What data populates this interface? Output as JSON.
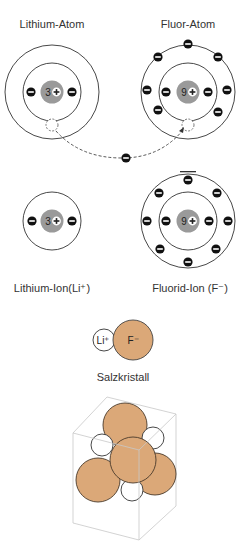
{
  "diagram": {
    "colors": {
      "shell": "#333333",
      "nucleus": "#9a9a9a",
      "electron": "#111111",
      "fluoride_fill": "#dba878",
      "lithium_fill": "#ffffff",
      "cube": "#bdbdbd"
    }
  },
  "atoms": {
    "lithium_atom": {
      "label": "Lithium-Atom",
      "nucleus": "3"
    },
    "fluor_atom": {
      "label": "Fluor-Atom",
      "nucleus": "9"
    },
    "lithium_ion": {
      "label": "Lithium-Ion(Li⁺)",
      "nucleus": "3"
    },
    "fluorid_ion": {
      "label": "Fluorid-Ion (F⁻)",
      "nucleus": "9"
    }
  },
  "pair": {
    "li_label": "Li⁺",
    "f_label": "F⁻"
  },
  "crystal": {
    "label": "Salzkristall"
  }
}
